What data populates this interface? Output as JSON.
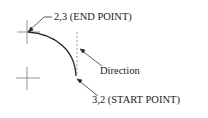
{
  "diagram": {
    "labels": {
      "end_point": "2,3 (END POINT)",
      "direction": "Direction",
      "start_point": "3,2 (START POINT)"
    },
    "colors": {
      "line": "#222222",
      "dashed": "#888888"
    }
  }
}
